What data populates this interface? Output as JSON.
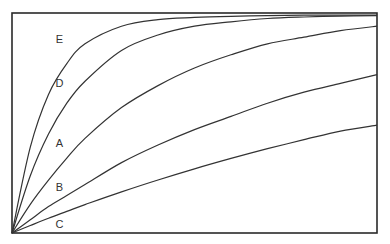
{
  "chart_data": {
    "type": "line",
    "title": "",
    "xlabel": "",
    "ylabel": "",
    "xlim": [
      0,
      1
    ],
    "ylim": [
      0,
      1
    ],
    "grid": false,
    "legend": "inline labels near curves",
    "x": [
      0,
      0.05,
      0.1,
      0.15,
      0.2,
      0.3,
      0.4,
      0.5,
      0.6,
      0.7,
      0.8,
      0.9,
      1.0
    ],
    "series": [
      {
        "name": "E",
        "label_pos": [
          0.13,
          0.88
        ],
        "values": [
          0,
          0.39,
          0.63,
          0.77,
          0.86,
          0.94,
          0.97,
          0.98,
          0.985,
          0.988,
          0.99,
          0.99,
          0.99
        ]
      },
      {
        "name": "D",
        "label_pos": [
          0.13,
          0.68
        ],
        "values": [
          0,
          0.26,
          0.45,
          0.59,
          0.69,
          0.83,
          0.9,
          0.94,
          0.96,
          0.975,
          0.982,
          0.986,
          0.988
        ]
      },
      {
        "name": "A",
        "label_pos": [
          0.13,
          0.41
        ],
        "values": [
          0,
          0.13,
          0.24,
          0.34,
          0.43,
          0.57,
          0.67,
          0.75,
          0.81,
          0.86,
          0.89,
          0.92,
          0.94
        ]
      },
      {
        "name": "B",
        "label_pos": [
          0.13,
          0.21
        ],
        "values": [
          0,
          0.06,
          0.12,
          0.17,
          0.22,
          0.32,
          0.4,
          0.47,
          0.53,
          0.59,
          0.64,
          0.68,
          0.72
        ]
      },
      {
        "name": "C",
        "label_pos": [
          0.13,
          0.04
        ],
        "values": [
          0,
          0.034,
          0.067,
          0.098,
          0.129,
          0.187,
          0.241,
          0.292,
          0.339,
          0.383,
          0.424,
          0.463,
          0.49
        ]
      }
    ]
  },
  "plot_area": {
    "left": 12,
    "top": 13,
    "right": 377,
    "bottom": 233
  },
  "colors": {
    "line": "#333333",
    "frame": "#2a2a2a",
    "background": "#ffffff"
  }
}
